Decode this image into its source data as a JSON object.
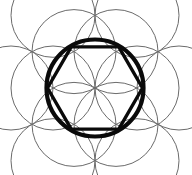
{
  "figure": {
    "kind": "sacred-geometry-diagram",
    "canvas": {
      "width": 192,
      "height": 175,
      "background_color": "#ffffff"
    },
    "center": {
      "x": 95,
      "y": 88
    },
    "colors": {
      "thin_stroke": "#6b6b6b",
      "bold_stroke": "#0a0a0a",
      "background": "#ffffff"
    },
    "strokes": {
      "thin_width": 1.0,
      "bold_circle_width": 4.2,
      "bold_hexagon_width": 3.4
    },
    "inner_ring": {
      "label": "inner ring of six overlapping circles forming a six-petal rosette",
      "count": 6,
      "radius": 42,
      "orbit_radius": 42,
      "start_angle_deg": 0,
      "step_angle_deg": 60,
      "centers": [
        {
          "x": 137.0,
          "y": 88.0
        },
        {
          "x": 116.0,
          "y": 51.6
        },
        {
          "x": 74.0,
          "y": 51.6
        },
        {
          "x": 53.0,
          "y": 88.0
        },
        {
          "x": 74.0,
          "y": 124.4
        },
        {
          "x": 116.0,
          "y": 124.4
        }
      ]
    },
    "outer_ring": {
      "label": "outer ring of six overlapping circles",
      "count": 6,
      "radius": 42,
      "orbit_radius": 84,
      "start_angle_deg": 0,
      "step_angle_deg": 60,
      "centers": [
        {
          "x": 179.0,
          "y": 88.0
        },
        {
          "x": 137.0,
          "y": 15.3
        },
        {
          "x": 53.0,
          "y": 15.3
        },
        {
          "x": 11.0,
          "y": 88.0
        },
        {
          "x": 53.0,
          "y": 160.7
        },
        {
          "x": 137.0,
          "y": 160.7
        }
      ]
    },
    "bold_circle": {
      "label": "bold enclosing circle",
      "center": {
        "x": 95,
        "y": 88
      },
      "radius": 48.5
    },
    "bold_hexagon": {
      "label": "bold hexagon inscribed in the enclosing circle",
      "sides": 6,
      "circumradius": 47.5,
      "orientation": "flat-top",
      "vertex_angles_deg": [
        0,
        60,
        120,
        180,
        240,
        300
      ],
      "vertices": [
        {
          "x": 142.5,
          "y": 88.0
        },
        {
          "x": 118.75,
          "y": 46.85
        },
        {
          "x": 71.25,
          "y": 46.85
        },
        {
          "x": 47.5,
          "y": 88.0
        },
        {
          "x": 71.25,
          "y": 129.15
        },
        {
          "x": 118.75,
          "y": 129.15
        }
      ]
    }
  }
}
